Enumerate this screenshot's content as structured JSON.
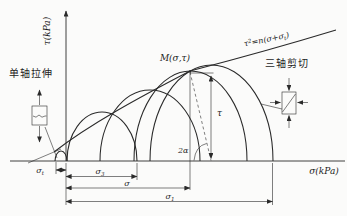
{
  "diagram": {
    "axes": {
      "y_label": "τ(kPa)",
      "x_label": "σ(kPa)"
    },
    "envelope": {
      "eq_var": "τ",
      "eq_sup": "2",
      "eq_mid": "=n(σ+σ",
      "eq_sub": "t",
      "eq_close": ")"
    },
    "point_m": {
      "label": "M(σ,τ)"
    },
    "measures": {
      "tau": "τ",
      "angle": "2α",
      "sigma_t": {
        "base": "σ",
        "sub": "t"
      },
      "sigma_3": {
        "base": "σ",
        "sub": "3"
      },
      "sigma": {
        "base": "σ",
        "sub": ""
      },
      "sigma_1": {
        "base": "σ",
        "sub": "1"
      }
    },
    "annotations": {
      "left_specimen": "单轴拉伸",
      "right_specimen": "三轴剪切"
    },
    "colors": {
      "line": "#2a2a2a",
      "background": "#fbfbfa"
    }
  }
}
